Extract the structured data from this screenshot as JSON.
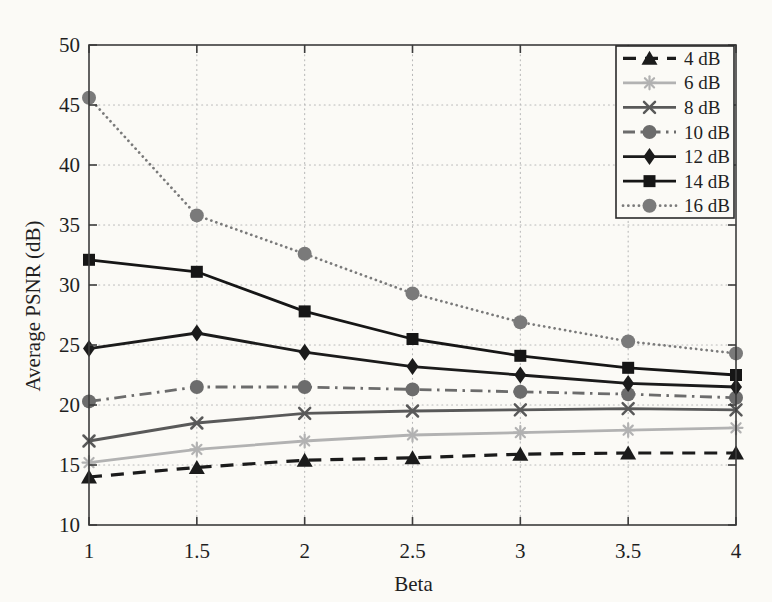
{
  "figure": {
    "background": "#fbfaf6"
  },
  "chart_data": {
    "type": "line",
    "title": "",
    "xlabel": "Beta",
    "ylabel": "Average PSNR (dB)",
    "x": [
      1,
      1.5,
      2,
      2.5,
      3,
      3.5,
      4
    ],
    "xlim": [
      1,
      4
    ],
    "ylim": [
      10,
      50
    ],
    "xticks": [
      1,
      1.5,
      2,
      2.5,
      3,
      3.5,
      4
    ],
    "yticks": [
      10,
      15,
      20,
      25,
      30,
      35,
      40,
      45,
      50
    ],
    "grid": true,
    "grid_style": "dotted",
    "legend_position": "top-right",
    "colors": {
      "background": "#fbfaf6",
      "axis": "#3c3c3c",
      "grid": "#b9b9b9",
      "text": "#1f1f1f",
      "legend_border": "#2a2a2a"
    },
    "series": [
      {
        "name": "4 dB",
        "values": [
          14.0,
          14.8,
          15.4,
          15.6,
          15.9,
          16.0,
          16.0
        ],
        "color": "#1b1b1b",
        "line": "dashed",
        "marker": "triangle"
      },
      {
        "name": "6 dB",
        "values": [
          15.2,
          16.3,
          17.0,
          17.5,
          17.7,
          17.9,
          18.1
        ],
        "color": "#b2b2b2",
        "line": "solid",
        "marker": "asterisk"
      },
      {
        "name": "8 dB",
        "values": [
          17.0,
          18.5,
          19.3,
          19.5,
          19.6,
          19.7,
          19.6
        ],
        "color": "#595959",
        "line": "solid",
        "marker": "x"
      },
      {
        "name": "10 dB",
        "values": [
          20.3,
          21.5,
          21.5,
          21.3,
          21.1,
          20.9,
          20.6
        ],
        "color": "#6c6c6c",
        "line": "dashdot",
        "marker": "circle"
      },
      {
        "name": "12 dB",
        "values": [
          24.7,
          26.0,
          24.4,
          23.2,
          22.5,
          21.8,
          21.5
        ],
        "color": "#1b1b1b",
        "line": "solid",
        "marker": "diamond"
      },
      {
        "name": "14 dB",
        "values": [
          32.1,
          31.1,
          27.8,
          25.5,
          24.1,
          23.1,
          22.5
        ],
        "color": "#161616",
        "line": "solid",
        "marker": "square"
      },
      {
        "name": "16 dB",
        "values": [
          45.6,
          35.8,
          32.6,
          29.3,
          26.9,
          25.3,
          24.3
        ],
        "color": "#7a7a7a",
        "line": "dotted",
        "marker": "circle"
      }
    ]
  }
}
